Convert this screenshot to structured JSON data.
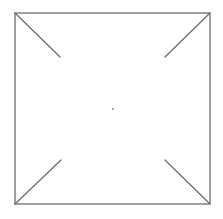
{
  "canvas": {
    "width": 223,
    "height": 219,
    "background": "#ffffff"
  },
  "style": {
    "stroke_color": "#6e6e6e",
    "stroke_width": 1.3,
    "dot_color": "#8a8a8a"
  },
  "frame": {
    "x": 15,
    "y": 13,
    "width": 195,
    "height": 191
  },
  "diagonals": [
    {
      "name": "top-left",
      "x1": 15,
      "y1": 13,
      "x2": 60,
      "y2": 57
    },
    {
      "name": "top-right",
      "x1": 210,
      "y1": 13,
      "x2": 165,
      "y2": 57
    },
    {
      "name": "bottom-left",
      "x1": 15,
      "y1": 204,
      "x2": 61,
      "y2": 160
    },
    {
      "name": "bottom-right",
      "x1": 210,
      "y1": 204,
      "x2": 165,
      "y2": 160
    }
  ],
  "center_dot": {
    "cx": 113,
    "cy": 109,
    "r": 1
  }
}
